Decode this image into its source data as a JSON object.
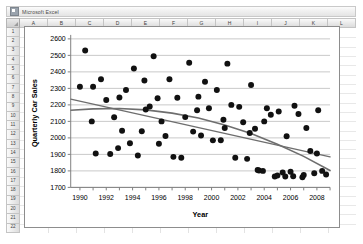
{
  "window": {
    "title": "Microsoft Excel",
    "logo_icon": "excel-logo-icon"
  },
  "sheet": {
    "columns": [
      "A",
      "B",
      "C",
      "D",
      "E",
      "F",
      "G",
      "H",
      "I",
      "J",
      "K",
      "L"
    ],
    "rows": [
      "1",
      "2",
      "3",
      "4",
      "5",
      "6",
      "7",
      "8",
      "9",
      "10",
      "11",
      "12",
      "13",
      "14",
      "15",
      "16",
      "17",
      "18",
      "19",
      "20",
      "21",
      "22"
    ],
    "select_all_icon": "select-all-corner-icon"
  },
  "chart_data": {
    "type": "scatter",
    "title": "",
    "xlabel": "Year",
    "ylabel": "Quarterly Car Sales",
    "xlim": [
      1989.3,
      2009.0
    ],
    "ylim": [
      1700,
      2600
    ],
    "xticks": [
      1990,
      1992,
      1994,
      1996,
      1998,
      2000,
      2002,
      2004,
      2006,
      2008
    ],
    "xtick_labels": [
      "1990",
      "1992",
      "1994",
      "1996",
      "1998",
      "2000",
      "2002",
      "2004",
      "2006",
      "2008"
    ],
    "yticks": [
      1700,
      1800,
      1900,
      2000,
      2100,
      2200,
      2300,
      2400,
      2500,
      2600
    ],
    "ytick_labels": [
      "1700",
      "1800",
      "1900",
      "2000",
      "2100",
      "2200",
      "2300",
      "2400",
      "2500",
      "2600"
    ],
    "grid": "horizontal",
    "legend": "none",
    "marker": {
      "shape": "circle",
      "color": "#111111",
      "size": 3.0
    },
    "points": [
      [
        1990.0,
        2310
      ],
      [
        1990.4,
        2530
      ],
      [
        1990.9,
        2100
      ],
      [
        1991.2,
        1905
      ],
      [
        1991.6,
        2355
      ],
      [
        1992.0,
        2230
      ],
      [
        1992.3,
        1902
      ],
      [
        1992.6,
        2125
      ],
      [
        1992.9,
        1938
      ],
      [
        1993.2,
        2043
      ],
      [
        1993.5,
        2290
      ],
      [
        1993.8,
        1968
      ],
      [
        1994.1,
        2420
      ],
      [
        1994.4,
        1893
      ],
      [
        1994.7,
        2040
      ],
      [
        1995.0,
        2172
      ],
      [
        1995.3,
        2190
      ],
      [
        1995.6,
        2495
      ],
      [
        1995.9,
        2240
      ],
      [
        1996.2,
        2100
      ],
      [
        1996.5,
        2012
      ],
      [
        1996.8,
        2355
      ],
      [
        1997.1,
        1885
      ],
      [
        1997.4,
        2243
      ],
      [
        1997.7,
        1880
      ],
      [
        1998.0,
        2126
      ],
      [
        1998.3,
        2455
      ],
      [
        1998.6,
        2038
      ],
      [
        1998.9,
        2168
      ],
      [
        1999.2,
        2015
      ],
      [
        1999.5,
        2340
      ],
      [
        1999.8,
        2180
      ],
      [
        2000.1,
        1985
      ],
      [
        2000.4,
        2290
      ],
      [
        2000.7,
        1986
      ],
      [
        2000.9,
        2110
      ],
      [
        2001.2,
        2450
      ],
      [
        2001.5,
        2200
      ],
      [
        2001.8,
        1880
      ],
      [
        2002.1,
        2188
      ],
      [
        2002.4,
        2095
      ],
      [
        2002.7,
        1873
      ],
      [
        2003.0,
        2320
      ],
      [
        2003.3,
        2055
      ],
      [
        2003.6,
        1802
      ],
      [
        2003.9,
        1800
      ],
      [
        2004.2,
        2180
      ],
      [
        2004.5,
        2140
      ],
      [
        2004.8,
        1766
      ],
      [
        2005.1,
        2160
      ],
      [
        2005.4,
        1790
      ],
      [
        2005.7,
        2010
      ],
      [
        2006.0,
        1795
      ],
      [
        2006.3,
        2195
      ],
      [
        2006.6,
        2145
      ],
      [
        2006.9,
        1762
      ],
      [
        2007.2,
        2060
      ],
      [
        2007.5,
        1920
      ],
      [
        2007.8,
        1786
      ],
      [
        2008.1,
        2168
      ],
      [
        2008.4,
        1800
      ],
      [
        2008.7,
        1778
      ],
      [
        1991.0,
        2310
      ],
      [
        1993.0,
        2245
      ],
      [
        1994.9,
        2348
      ],
      [
        1996.0,
        1965
      ],
      [
        1999.0,
        2250
      ],
      [
        2001.0,
        2060
      ],
      [
        2002.9,
        2030
      ],
      [
        2004.0,
        2100
      ],
      [
        2005.0,
        1772
      ],
      [
        2006.2,
        1768
      ],
      [
        2007.0,
        1775
      ],
      [
        2008.0,
        1905
      ],
      [
        2003.5,
        1805
      ],
      [
        2005.6,
        1766
      ]
    ],
    "trendlines": [
      {
        "name": "linear",
        "type": "linear",
        "color": "#6e6e6e",
        "endpoints": [
          [
            1989.3,
            2235
          ],
          [
            2009.0,
            1885
          ]
        ]
      },
      {
        "name": "quadratic",
        "type": "polynomial-order-2",
        "color": "#6e6e6e",
        "vertex_year": 1993.5,
        "samples": [
          [
            1989.3,
            2168
          ],
          [
            1991.0,
            2176
          ],
          [
            1993.0,
            2178
          ],
          [
            1995.0,
            2170
          ],
          [
            1997.0,
            2150
          ],
          [
            1999.0,
            2120
          ],
          [
            2001.0,
            2078
          ],
          [
            2003.0,
            2026
          ],
          [
            2005.0,
            1962
          ],
          [
            2007.0,
            1888
          ],
          [
            2009.0,
            1802
          ]
        ]
      }
    ]
  }
}
